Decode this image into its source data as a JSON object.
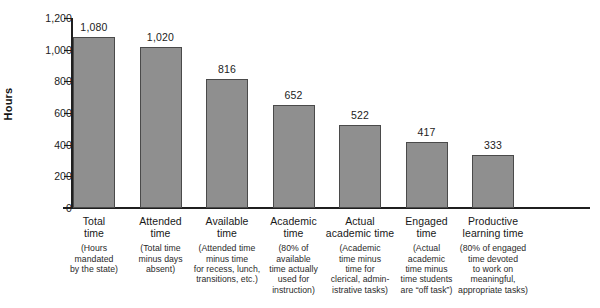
{
  "chart_data": {
    "type": "bar",
    "title": "",
    "xlabel": "",
    "ylabel": "Hours",
    "ylim": [
      0,
      1200
    ],
    "yticks": [
      0,
      200,
      400,
      600,
      800,
      1000,
      1200
    ],
    "ytick_labels": [
      "0",
      "200",
      "400",
      "600",
      "800",
      "1,000",
      "1,200"
    ],
    "grid": false,
    "legend": "none",
    "bar_color": "#8f8f8f",
    "bar_edge_color": "#4a4a4a",
    "axis_color": "#1f1f1f",
    "categories": [
      "Total\ntime",
      "Attended\ntime",
      "Available\ntime",
      "Academic\ntime",
      "Actual\nacademic time",
      "Engaged\ntime",
      "Productive\nlearning time"
    ],
    "values": [
      1080,
      1020,
      816,
      652,
      522,
      417,
      333
    ],
    "value_labels": [
      "1,080",
      "1,020",
      "816",
      "652",
      "522",
      "417",
      "333"
    ],
    "category_descriptions": [
      "(Hours\nmandated\nby the state)",
      "(Total time\nminus days\nabsent)",
      "(Attended time\nminus time\nfor recess, lunch,\ntransitions, etc.)",
      "(80% of\navailable\ntime actually\nused for\ninstruction)",
      "(Academic\ntime minus\ntime for\nclerical, admin-\nistrative tasks)",
      "(Actual\nacademic\ntime minus\ntime students\nare “off task”)",
      "(80% of engaged\ntime devoted\nto work on\nmeaningful,\nappropriate tasks)"
    ]
  }
}
